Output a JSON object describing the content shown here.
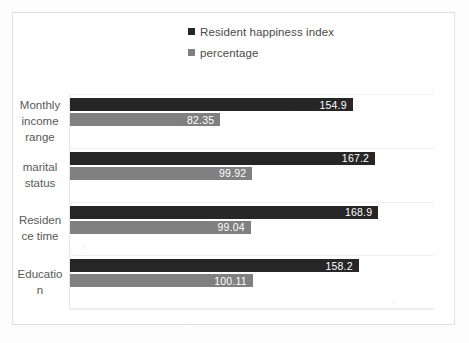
{
  "chart_data": {
    "type": "bar",
    "orientation": "horizontal",
    "title": "",
    "xlabel": "",
    "ylabel": "",
    "grid": true,
    "legend_position": "top",
    "xlim": [
      0,
      200
    ],
    "categories": [
      "Monthly income range",
      "marital status",
      "Residence time",
      "Education"
    ],
    "category_lines": [
      [
        "Monthly",
        "income",
        "range"
      ],
      [
        "marital",
        "status"
      ],
      [
        "Residen",
        "ce time"
      ],
      [
        "Educatio",
        "n"
      ]
    ],
    "series": [
      {
        "name": "Resident happiness index",
        "color": "#262626",
        "values": [
          154.9,
          167.2,
          168.9,
          158.2
        ],
        "labels": [
          "154.9",
          "167.2",
          "168.9",
          "158.2"
        ]
      },
      {
        "name": "percentage",
        "color": "#808080",
        "values": [
          82.35,
          99.92,
          99.04,
          100.11
        ],
        "labels": [
          "82.35",
          "99.92",
          "99.04",
          "100.11"
        ]
      }
    ]
  },
  "legend": {
    "items": [
      {
        "label": "Resident happiness index",
        "color": "#262626"
      },
      {
        "label": "percentage",
        "color": "#808080"
      }
    ]
  }
}
